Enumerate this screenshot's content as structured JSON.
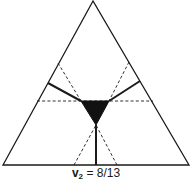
{
  "diagram": {
    "type": "simplex-triangle",
    "caption": {
      "variable": "v",
      "subscript": "2",
      "equals": "= 8/13"
    },
    "colors": {
      "stroke": "#1a1a1a",
      "fill_core": "#111111",
      "background": "#ffffff"
    },
    "outer_triangle": {
      "apex": [
        93,
        1
      ],
      "bottom_left": [
        3,
        165
      ],
      "bottom_right": [
        189,
        165
      ]
    },
    "core_region": {
      "points": [
        [
          81,
          101
        ],
        [
          109,
          101
        ],
        [
          96,
          125
        ]
      ],
      "fill": "black"
    },
    "solid_lines": [
      {
        "from": [
          48,
          83
        ],
        "to": [
          81,
          101
        ]
      },
      {
        "from": [
          140,
          81
        ],
        "to": [
          109,
          101
        ]
      },
      {
        "from": [
          96,
          125
        ],
        "to": [
          96,
          165
        ]
      }
    ],
    "dashed_lines": [
      {
        "from": [
          37,
          101
        ],
        "to": [
          153,
          101
        ]
      },
      {
        "from": [
          58,
          63
        ],
        "to": [
          81,
          101
        ]
      },
      {
        "from": [
          129,
          62
        ],
        "to": [
          109,
          101
        ]
      },
      {
        "from": [
          74,
          165
        ],
        "to": [
          96,
          125
        ]
      },
      {
        "from": [
          117,
          165
        ],
        "to": [
          96,
          125
        ]
      }
    ]
  }
}
